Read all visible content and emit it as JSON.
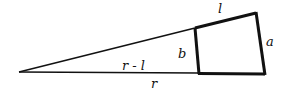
{
  "diagram": {
    "type": "geometry",
    "labels": {
      "l": "l",
      "a": "a",
      "b": "b",
      "r_minus_l": "r - l",
      "r": "r"
    },
    "colors": {
      "stroke": "#111111",
      "background": "#ffffff"
    }
  }
}
